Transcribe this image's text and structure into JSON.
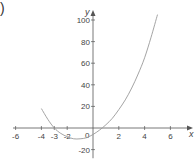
{
  "figure_label": ")",
  "chart_data": {
    "type": "line",
    "title": "",
    "xlabel": "x",
    "ylabel": "y",
    "xlim": [
      -6.2,
      7.2
    ],
    "ylim": [
      -28,
      110
    ],
    "grid": false,
    "legend": null,
    "x_ticks": [
      -6,
      -4,
      -3,
      -2,
      0,
      2,
      4,
      6
    ],
    "x_tick_labels": [
      "-6",
      "-4",
      "-3",
      "-2",
      "0",
      "2",
      "4",
      "6"
    ],
    "y_ticks": [
      100,
      80,
      60,
      40,
      20,
      -20
    ],
    "y_tick_labels": [
      "100",
      "80",
      "60",
      "40",
      "20",
      "-20"
    ],
    "series": [
      {
        "name": "curve",
        "color": "#9a9a9a",
        "x": [
          -4,
          -3.5,
          -3,
          -2.5,
          -2,
          -1.5,
          -1,
          -0.5,
          0,
          0.5,
          1,
          1.5,
          2,
          2.5,
          3,
          3.5,
          4,
          4.5,
          5
        ],
        "y": [
          18,
          8,
          0,
          -5,
          -8,
          -10,
          -10,
          -9,
          -6,
          -2,
          3,
          9,
          17,
          26,
          37,
          50,
          65,
          84,
          105
        ]
      }
    ]
  }
}
